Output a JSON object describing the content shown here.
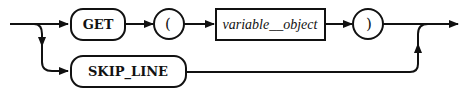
{
  "diagram": {
    "type": "railroad-syntax-diagram",
    "main_path": {
      "get_keyword": "GET",
      "open_paren": "(",
      "variable": "variable__object",
      "close_paren": ")"
    },
    "alt_path": {
      "skip_keyword": "SKIP_LINE"
    },
    "colors": {
      "stroke": "#111111",
      "background": "#ffffff"
    }
  }
}
